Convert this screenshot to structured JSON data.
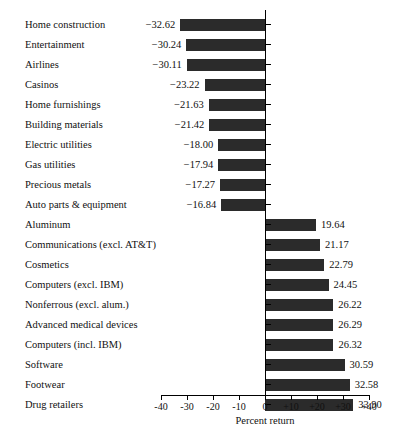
{
  "chart_data": {
    "type": "bar",
    "orientation": "horizontal",
    "title": "",
    "xlabel": "Percent return",
    "ylabel": "",
    "xlim": [
      -40,
      40
    ],
    "grid": false,
    "legend": null,
    "tick_labels": [
      "-40",
      "-30",
      "-20",
      "-10",
      "0",
      "+10",
      "+20",
      "+30",
      "+40"
    ],
    "tick_values": [
      -40,
      -30,
      -20,
      -10,
      0,
      10,
      20,
      30,
      40
    ],
    "bar_color": "#2b2b2b",
    "axis_color": "#000000",
    "categories": [
      "Home construction",
      "Entertainment",
      "Airlines",
      "Casinos",
      "Home furnishings",
      "Building materials",
      "Electric utilities",
      "Gas utilities",
      "Precious metals",
      "Auto parts & equipment",
      "Aluminum",
      "Communications (excl. AT&T)",
      "Cosmetics",
      "Computers (excl. IBM)",
      "Nonferrous (excl. alum.)",
      "Advanced medical devices",
      "Computers (incl. IBM)",
      "Software",
      "Footwear",
      "Drug retailers"
    ],
    "values": [
      -32.62,
      -30.24,
      -30.11,
      -23.22,
      -21.63,
      -21.42,
      -18.0,
      -17.94,
      -17.27,
      -16.84,
      19.64,
      21.17,
      22.79,
      24.45,
      26.22,
      26.29,
      26.32,
      30.59,
      32.58,
      33.9
    ],
    "value_labels": [
      "−32.62",
      "−30.24",
      "−30.11",
      "−23.22",
      "−21.63",
      "−21.42",
      "−18.00",
      "−17.94",
      "−17.27",
      "−16.84",
      "19.64",
      "21.17",
      "22.79",
      "24.45",
      "26.22",
      "26.29",
      "26.32",
      "30.59",
      "32.58",
      "33.90"
    ]
  }
}
